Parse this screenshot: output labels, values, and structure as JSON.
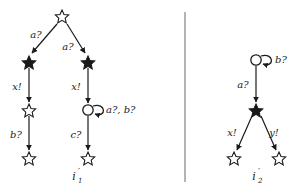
{
  "figure": {
    "divider": {
      "name": "vertical-divider",
      "x": 185,
      "y1": 12,
      "y2": 182
    },
    "colors": {
      "stroke": "#1a1a1a",
      "node_fill_hollow": "#ffffff",
      "node_fill_solid": "#1a1a1a",
      "background": "#ffffff",
      "divider": "#8a8a8a"
    },
    "automata": [
      {
        "id": "left",
        "name": "automaton-left",
        "init_label": "i",
        "init_prime": "′",
        "init_sub": "1",
        "init_label_full": "i′1",
        "nodes": [
          {
            "id": "L0",
            "shape": "star-hollow",
            "x": 62,
            "y": 16
          },
          {
            "id": "L1",
            "shape": "star-solid",
            "x": 29,
            "y": 62
          },
          {
            "id": "L2",
            "shape": "star-solid",
            "x": 88,
            "y": 62
          },
          {
            "id": "L3",
            "shape": "star-hollow",
            "x": 29,
            "y": 110
          },
          {
            "id": "L4",
            "shape": "circle-hollow",
            "x": 88,
            "y": 110
          },
          {
            "id": "L5",
            "shape": "star-hollow",
            "x": 29,
            "y": 158
          },
          {
            "id": "L6",
            "shape": "star-hollow",
            "x": 88,
            "y": 158
          }
        ],
        "edges": [
          {
            "from": "L0",
            "to": "L1",
            "label": "a?",
            "label_x": 36,
            "label_y": 38
          },
          {
            "from": "L0",
            "to": "L2",
            "label": "a?",
            "label_x": 68,
            "label_y": 50
          },
          {
            "from": "L1",
            "to": "L3",
            "label": "x!",
            "label_x": 17,
            "label_y": 90
          },
          {
            "from": "L2",
            "to": "L4",
            "label": "x!",
            "label_x": 76,
            "label_y": 90
          },
          {
            "from": "L3",
            "to": "L5",
            "label": "b?",
            "label_x": 16,
            "label_y": 138
          },
          {
            "from": "L4",
            "to": "L6",
            "label": "c?",
            "label_x": 76,
            "label_y": 138
          }
        ],
        "self_loops": [
          {
            "at": "L4",
            "label": "a?, b?",
            "label_x": 106,
            "label_y": 113
          }
        ]
      },
      {
        "id": "right",
        "name": "automaton-right",
        "init_label": "i",
        "init_prime": "′",
        "init_sub": "2",
        "init_label_full": "i′2",
        "nodes": [
          {
            "id": "R0",
            "shape": "circle-hollow",
            "x": 256,
            "y": 60
          },
          {
            "id": "R1",
            "shape": "star-solid",
            "x": 256,
            "y": 110
          },
          {
            "id": "R2",
            "shape": "star-hollow",
            "x": 234,
            "y": 158
          },
          {
            "id": "R3",
            "shape": "star-hollow",
            "x": 279,
            "y": 158
          }
        ],
        "edges": [
          {
            "from": "R0",
            "to": "R1",
            "label": "a?",
            "label_x": 241,
            "label_y": 88
          },
          {
            "from": "R1",
            "to": "R2",
            "label": "x!",
            "label_x": 232,
            "label_y": 136
          },
          {
            "from": "R1",
            "to": "R3",
            "label": "y!",
            "label_x": 272,
            "label_y": 136
          }
        ],
        "self_loops": [
          {
            "at": "R0",
            "label": "b?",
            "label_x": 274,
            "label_y": 63
          }
        ]
      }
    ]
  }
}
